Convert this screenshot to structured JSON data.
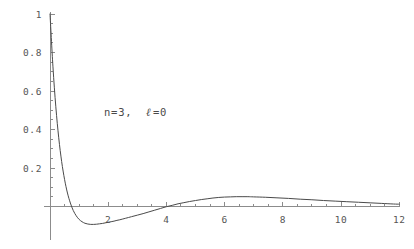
{
  "chart_data": {
    "type": "line",
    "title": "",
    "subtitle": "",
    "xlabel": "",
    "ylabel": "",
    "annotation": "n=3, ℓ=0",
    "annotation_parts": {
      "n_part": "n=3,",
      "ell_symbol": "ℓ",
      "ell_value": "=0"
    },
    "xlim": [
      0,
      12
    ],
    "ylim": [
      -0.09,
      1.0
    ],
    "grid": false,
    "legend": null,
    "x_ticks_major": [
      2,
      4,
      6,
      8,
      10,
      12
    ],
    "x_tick_labels": [
      "2",
      "4",
      "6",
      "8",
      "10",
      "12"
    ],
    "x_tick_minor_step": 0.5,
    "y_ticks_major": [
      0.2,
      0.4,
      0.6,
      0.8,
      1
    ],
    "y_tick_labels": [
      "0.2",
      "0.4",
      "0.6",
      "0.8",
      "1"
    ],
    "y_tick_minor_step": 0.05,
    "line_color": "#4a4a4a",
    "axis_color": "#8c8c8c",
    "background_color": "#ffffff",
    "series": [
      {
        "name": "R_30(r)",
        "x": [
          0.0,
          0.1,
          0.2,
          0.3,
          0.4,
          0.5,
          0.6,
          0.7,
          0.8,
          0.9,
          1.0,
          1.1,
          1.2,
          1.3,
          1.4,
          1.5,
          1.6,
          1.7,
          1.8,
          1.9,
          2.0,
          2.1,
          2.2,
          2.3,
          2.4,
          2.5,
          2.6,
          2.8,
          3.0,
          3.2,
          3.4,
          3.6,
          3.8,
          4.0,
          4.2,
          4.4,
          4.6,
          4.8,
          5.0,
          5.2,
          5.4,
          5.6,
          5.8,
          6.0,
          6.2,
          6.4,
          6.6,
          6.8,
          7.0,
          7.4,
          7.8,
          8.2,
          8.6,
          9.0,
          9.4,
          9.8,
          10.2,
          10.6,
          11.0,
          11.4,
          11.8,
          12.0
        ],
        "y": [
          1.0,
          0.729,
          0.518,
          0.357,
          0.234,
          0.141,
          0.07,
          0.018,
          -0.021,
          -0.048,
          -0.067,
          -0.079,
          -0.087,
          -0.091,
          -0.093,
          -0.093,
          -0.092,
          -0.09,
          -0.088,
          -0.085,
          -0.082,
          -0.079,
          -0.076,
          -0.072,
          -0.069,
          -0.065,
          -0.061,
          -0.053,
          -0.045,
          -0.037,
          -0.028,
          -0.019,
          -0.01,
          -0.001,
          0.006,
          0.014,
          0.02,
          0.026,
          0.031,
          0.036,
          0.04,
          0.044,
          0.047,
          0.049,
          0.05,
          0.051,
          0.051,
          0.051,
          0.05,
          0.048,
          0.045,
          0.042,
          0.038,
          0.035,
          0.031,
          0.028,
          0.025,
          0.022,
          0.019,
          0.016,
          0.013,
          0.012
        ],
        "zero_crossings": [
          0.74,
          3.98
        ],
        "minimum": {
          "x": 1.45,
          "y": -0.093
        },
        "secondary_maximum": {
          "x": 6.5,
          "y": 0.051
        },
        "start_point": {
          "x": 0,
          "y": 1.0
        },
        "end_point": {
          "x": 12,
          "y": 0.012
        }
      }
    ]
  },
  "plot_geometry": {
    "origin_px": {
      "x": 50,
      "y": 206.5
    },
    "x_scale_px_per_unit": 29.1,
    "y_scale_px_per_unit": 192.5
  }
}
